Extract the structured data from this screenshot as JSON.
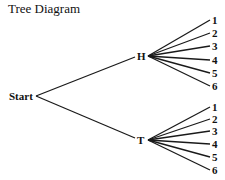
{
  "title": "Tree Diagram",
  "root": {
    "label": "Start"
  },
  "branches": [
    {
      "label": "H",
      "leaves": [
        "1",
        "2",
        "3",
        "4",
        "5",
        "6"
      ]
    },
    {
      "label": "T",
      "leaves": [
        "1",
        "2",
        "3",
        "4",
        "5",
        "6"
      ]
    }
  ],
  "colors": {
    "line": "#1a1a1a",
    "text": "#111111",
    "background": "#ffffff"
  }
}
